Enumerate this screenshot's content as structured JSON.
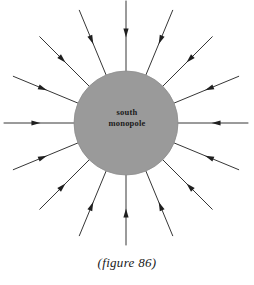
{
  "figure": {
    "caption": "(figure 86)",
    "label_line1": "south",
    "label_line2": "monopole",
    "colors": {
      "sphere_fill": "#9a9a9a",
      "sphere_stroke": "#8d8d8d",
      "field_line": "#1f1f1f",
      "background": "#ffffff",
      "text": "#1a1a1a"
    },
    "geometry": {
      "center_x": 126,
      "center_y": 123,
      "sphere_radius": 52,
      "field_line_outer_radius": 122,
      "field_line_count": 16,
      "field_line_angle_step_deg": 22.5,
      "arrowhead_position_fraction": 0.45,
      "field_direction": "inward"
    }
  },
  "chart_data": {
    "type": "diagram",
    "title": "(figure 86)",
    "subject": "south monopole",
    "series": [
      {
        "name": "field-lines",
        "direction": "inward",
        "count": 16,
        "angles_deg": [
          0,
          22.5,
          45,
          67.5,
          90,
          112.5,
          135,
          157.5,
          180,
          202.5,
          225,
          247.5,
          270,
          292.5,
          315,
          337.5
        ]
      }
    ],
    "legend": [],
    "grid": false,
    "xlabel": "",
    "ylabel": ""
  }
}
